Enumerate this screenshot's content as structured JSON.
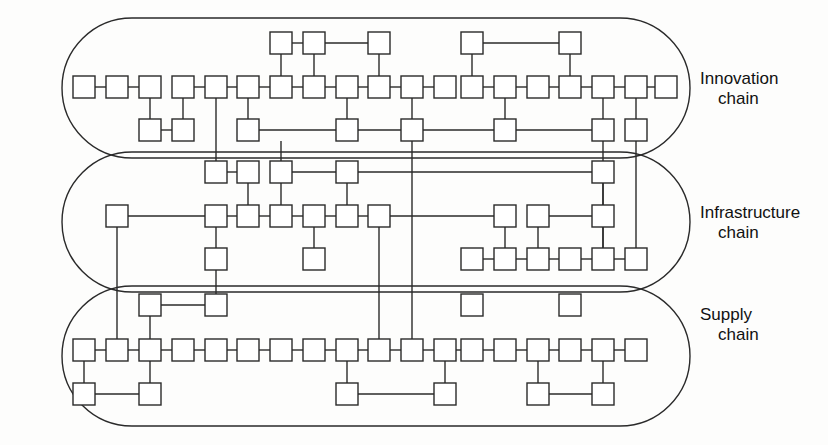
{
  "figure": {
    "background_color": "#fdfdfc",
    "line_color": "#2a2a2a",
    "node_fill": "#ffffff"
  },
  "lanes": [
    {
      "id": "innovation",
      "label_line1": "Innovation",
      "label_line2": "chain",
      "label_x": 700,
      "label_y": 84,
      "capsule": {
        "x": 62,
        "y": 18,
        "w": 628,
        "h": 140,
        "r": 70
      }
    },
    {
      "id": "infrastructure",
      "label_line1": "Infrastructure",
      "label_line2": "chain",
      "label_x": 700,
      "label_y": 218,
      "capsule": {
        "x": 62,
        "y": 152,
        "w": 628,
        "h": 140,
        "r": 70
      }
    },
    {
      "id": "supply",
      "label_line1": "Supply",
      "label_line2": "chain",
      "label_x": 700,
      "label_y": 320,
      "capsule": {
        "x": 62,
        "y": 286,
        "w": 628,
        "h": 140,
        "r": 70
      }
    }
  ],
  "node_size": {
    "w": 22,
    "h": 22
  },
  "rows": {
    "innovation_top": 43,
    "innovation_main": 87,
    "innovation_bottom": 130,
    "infrastructure_top": 172,
    "infrastructure_main": 216,
    "infrastructure_bottom": 259,
    "supply_top": 305,
    "supply_main": 350,
    "supply_bottom": 394
  },
  "nodes": [
    {
      "id": "it1",
      "x": 281,
      "y": 43
    },
    {
      "id": "it2",
      "x": 314,
      "y": 43
    },
    {
      "id": "it3",
      "x": 379,
      "y": 43
    },
    {
      "id": "it4",
      "x": 472,
      "y": 43
    },
    {
      "id": "it5",
      "x": 570,
      "y": 43
    },
    {
      "id": "im1",
      "x": 84,
      "y": 87
    },
    {
      "id": "im2",
      "x": 117,
      "y": 87
    },
    {
      "id": "im3",
      "x": 150,
      "y": 87
    },
    {
      "id": "im4",
      "x": 183,
      "y": 87
    },
    {
      "id": "im5",
      "x": 216,
      "y": 87
    },
    {
      "id": "im6",
      "x": 248,
      "y": 87
    },
    {
      "id": "im7",
      "x": 281,
      "y": 87
    },
    {
      "id": "im8",
      "x": 314,
      "y": 87
    },
    {
      "id": "im9",
      "x": 347,
      "y": 87
    },
    {
      "id": "im10",
      "x": 379,
      "y": 87
    },
    {
      "id": "im11",
      "x": 412,
      "y": 87
    },
    {
      "id": "im12",
      "x": 445,
      "y": 87
    },
    {
      "id": "im13",
      "x": 472,
      "y": 87
    },
    {
      "id": "im14",
      "x": 505,
      "y": 87
    },
    {
      "id": "im15",
      "x": 538,
      "y": 87
    },
    {
      "id": "im16",
      "x": 570,
      "y": 87
    },
    {
      "id": "im17",
      "x": 603,
      "y": 87
    },
    {
      "id": "im18",
      "x": 636,
      "y": 87
    },
    {
      "id": "im19",
      "x": 666,
      "y": 87
    },
    {
      "id": "ib1",
      "x": 150,
      "y": 130
    },
    {
      "id": "ib2",
      "x": 183,
      "y": 130
    },
    {
      "id": "ib3",
      "x": 248,
      "y": 130
    },
    {
      "id": "ib4",
      "x": 347,
      "y": 130
    },
    {
      "id": "ib5",
      "x": 412,
      "y": 130
    },
    {
      "id": "ib6",
      "x": 505,
      "y": 130
    },
    {
      "id": "ib7",
      "x": 603,
      "y": 130
    },
    {
      "id": "ib8",
      "x": 636,
      "y": 130
    },
    {
      "id": "ft1",
      "x": 216,
      "y": 172
    },
    {
      "id": "ft2",
      "x": 248,
      "y": 172
    },
    {
      "id": "ft3",
      "x": 281,
      "y": 172
    },
    {
      "id": "ft4",
      "x": 347,
      "y": 172
    },
    {
      "id": "ft5",
      "x": 603,
      "y": 172
    },
    {
      "id": "fm0",
      "x": 117,
      "y": 216
    },
    {
      "id": "fm1",
      "x": 216,
      "y": 216
    },
    {
      "id": "fm2",
      "x": 248,
      "y": 216
    },
    {
      "id": "fm3",
      "x": 281,
      "y": 216
    },
    {
      "id": "fm4",
      "x": 314,
      "y": 216
    },
    {
      "id": "fm5",
      "x": 347,
      "y": 216
    },
    {
      "id": "fm6",
      "x": 379,
      "y": 216
    },
    {
      "id": "fm7",
      "x": 505,
      "y": 216
    },
    {
      "id": "fm8",
      "x": 538,
      "y": 216
    },
    {
      "id": "fm9",
      "x": 603,
      "y": 216
    },
    {
      "id": "fb1",
      "x": 216,
      "y": 259
    },
    {
      "id": "fb2",
      "x": 314,
      "y": 259
    },
    {
      "id": "fb3",
      "x": 472,
      "y": 259
    },
    {
      "id": "fb4",
      "x": 505,
      "y": 259
    },
    {
      "id": "fb5",
      "x": 538,
      "y": 259
    },
    {
      "id": "fb6",
      "x": 570,
      "y": 259
    },
    {
      "id": "fb7",
      "x": 603,
      "y": 259
    },
    {
      "id": "fb8",
      "x": 636,
      "y": 259
    },
    {
      "id": "st1",
      "x": 150,
      "y": 305
    },
    {
      "id": "st2",
      "x": 216,
      "y": 305
    },
    {
      "id": "st3",
      "x": 472,
      "y": 305
    },
    {
      "id": "st4",
      "x": 570,
      "y": 305
    },
    {
      "id": "sm1",
      "x": 84,
      "y": 350
    },
    {
      "id": "sm2",
      "x": 117,
      "y": 350
    },
    {
      "id": "sm3",
      "x": 150,
      "y": 350
    },
    {
      "id": "sm4",
      "x": 183,
      "y": 350
    },
    {
      "id": "sm5",
      "x": 216,
      "y": 350
    },
    {
      "id": "sm6",
      "x": 248,
      "y": 350
    },
    {
      "id": "sm7",
      "x": 281,
      "y": 350
    },
    {
      "id": "sm8",
      "x": 314,
      "y": 350
    },
    {
      "id": "sm9",
      "x": 347,
      "y": 350
    },
    {
      "id": "sm10",
      "x": 379,
      "y": 350
    },
    {
      "id": "sm11",
      "x": 412,
      "y": 350
    },
    {
      "id": "sm12",
      "x": 445,
      "y": 350
    },
    {
      "id": "sm13",
      "x": 472,
      "y": 350
    },
    {
      "id": "sm14",
      "x": 505,
      "y": 350
    },
    {
      "id": "sm15",
      "x": 538,
      "y": 350
    },
    {
      "id": "sm16",
      "x": 570,
      "y": 350
    },
    {
      "id": "sm17",
      "x": 603,
      "y": 350
    },
    {
      "id": "sm18",
      "x": 636,
      "y": 350
    },
    {
      "id": "sb1",
      "x": 84,
      "y": 394
    },
    {
      "id": "sb2",
      "x": 150,
      "y": 394
    },
    {
      "id": "sb3",
      "x": 347,
      "y": 394
    },
    {
      "id": "sb4",
      "x": 445,
      "y": 394
    },
    {
      "id": "sb5",
      "x": 538,
      "y": 394
    },
    {
      "id": "sb6",
      "x": 603,
      "y": 394
    }
  ],
  "edges": [
    {
      "from": "it1",
      "to": "it2"
    },
    {
      "from": "it2",
      "to": "it3"
    },
    {
      "from": "it4",
      "to": "it5"
    },
    {
      "from": "it1",
      "to": "im7"
    },
    {
      "from": "it2",
      "to": "im8"
    },
    {
      "from": "it3",
      "to": "im10"
    },
    {
      "from": "it4",
      "to": "im13"
    },
    {
      "from": "it5",
      "to": "im16"
    },
    {
      "from": "im1",
      "to": "im2"
    },
    {
      "from": "im2",
      "to": "im3"
    },
    {
      "from": "im4",
      "to": "im5"
    },
    {
      "from": "im5",
      "to": "im6"
    },
    {
      "from": "im6",
      "to": "im7"
    },
    {
      "from": "im7",
      "to": "im8"
    },
    {
      "from": "im8",
      "to": "im9"
    },
    {
      "from": "im9",
      "to": "im10"
    },
    {
      "from": "im10",
      "to": "im11"
    },
    {
      "from": "im11",
      "to": "im12"
    },
    {
      "from": "im13",
      "to": "im14"
    },
    {
      "from": "im14",
      "to": "im15"
    },
    {
      "from": "im15",
      "to": "im16"
    },
    {
      "from": "im16",
      "to": "im17"
    },
    {
      "from": "im17",
      "to": "im18"
    },
    {
      "from": "im18",
      "to": "im19"
    },
    {
      "from": "im3",
      "to": "ib1"
    },
    {
      "from": "im4",
      "to": "ib2"
    },
    {
      "from": "im6",
      "to": "ib3"
    },
    {
      "from": "im9",
      "to": "ib4"
    },
    {
      "from": "im11",
      "to": "ib5"
    },
    {
      "from": "im14",
      "to": "ib6"
    },
    {
      "from": "im17",
      "to": "ib7"
    },
    {
      "from": "im18",
      "to": "ib8"
    },
    {
      "from": "ib1",
      "to": "ib2"
    },
    {
      "from": "ib3",
      "to": "ib4"
    },
    {
      "from": "ib4",
      "to": "ib6"
    },
    {
      "from": "ib6",
      "to": "ib7"
    },
    {
      "from": "ft1",
      "to": "ft2"
    },
    {
      "from": "ft3",
      "to": "ft4"
    },
    {
      "from": "ft4",
      "to": "ft5"
    },
    {
      "from": "ft2",
      "to": "fm2"
    },
    {
      "from": "ft3",
      "to": "fm3"
    },
    {
      "from": "ft4",
      "to": "fm5"
    },
    {
      "from": "ft5",
      "to": "fm9"
    },
    {
      "from": "fm0",
      "to": "fm1"
    },
    {
      "from": "fm1",
      "to": "fm2"
    },
    {
      "from": "fm2",
      "to": "fm3"
    },
    {
      "from": "fm3",
      "to": "fm4"
    },
    {
      "from": "fm4",
      "to": "fm5"
    },
    {
      "from": "fm5",
      "to": "fm6"
    },
    {
      "from": "fm6",
      "to": "fm7"
    },
    {
      "from": "fm8",
      "to": "fm9"
    },
    {
      "from": "fm1",
      "to": "fb1"
    },
    {
      "from": "fm4",
      "to": "fb2"
    },
    {
      "from": "fm7",
      "to": "fb4"
    },
    {
      "from": "fm8",
      "to": "fb5"
    },
    {
      "from": "fm9",
      "to": "fb7"
    },
    {
      "from": "fb3",
      "to": "fb4"
    },
    {
      "from": "fb4",
      "to": "fb5"
    },
    {
      "from": "fb5",
      "to": "fb6"
    },
    {
      "from": "fb6",
      "to": "fb7"
    },
    {
      "from": "fb7",
      "to": "fb8"
    },
    {
      "from": "st1",
      "to": "st2"
    },
    {
      "from": "st1",
      "to": "sm3"
    },
    {
      "from": "sm1",
      "to": "sm2"
    },
    {
      "from": "sm2",
      "to": "sm3"
    },
    {
      "from": "sm3",
      "to": "sm4"
    },
    {
      "from": "sm4",
      "to": "sm5"
    },
    {
      "from": "sm5",
      "to": "sm6"
    },
    {
      "from": "sm6",
      "to": "sm7"
    },
    {
      "from": "sm7",
      "to": "sm8"
    },
    {
      "from": "sm8",
      "to": "sm9"
    },
    {
      "from": "sm9",
      "to": "sm10"
    },
    {
      "from": "sm10",
      "to": "sm11"
    },
    {
      "from": "sm11",
      "to": "sm12"
    },
    {
      "from": "sm12",
      "to": "sm13"
    },
    {
      "from": "sm13",
      "to": "sm14"
    },
    {
      "from": "sm14",
      "to": "sm15"
    },
    {
      "from": "sm15",
      "to": "sm16"
    },
    {
      "from": "sm16",
      "to": "sm17"
    },
    {
      "from": "sm17",
      "to": "sm18"
    },
    {
      "from": "sm1",
      "to": "sb1"
    },
    {
      "from": "sm3",
      "to": "sb2"
    },
    {
      "from": "sm9",
      "to": "sb3"
    },
    {
      "from": "sm12",
      "to": "sb4"
    },
    {
      "from": "sm15",
      "to": "sb5"
    },
    {
      "from": "sm17",
      "to": "sb6"
    },
    {
      "from": "sb1",
      "to": "sb2"
    },
    {
      "from": "sb3",
      "to": "sb4"
    },
    {
      "from": "sb5",
      "to": "sb6"
    }
  ],
  "cross_lane_edges": [
    {
      "id": "x1",
      "x": 216,
      "from_y": 98,
      "to_y": 172,
      "desc": "innovation-main-5 to infrastructure-top-1"
    },
    {
      "id": "x2",
      "x": 281,
      "from_y": 141,
      "to_y": 172,
      "desc": "innovation-bottom to infrastructure-top-3"
    },
    {
      "id": "x3",
      "x": 412,
      "from_y": 141,
      "to_y": 350,
      "desc": "innovation-bottom-5 down to supply-main-11"
    },
    {
      "id": "x4",
      "x": 379,
      "from_y": 227,
      "to_y": 350,
      "desc": "infrastructure-main-6 down to supply-main-10"
    },
    {
      "id": "x5",
      "x": 603,
      "from_y": 141,
      "to_y": 259,
      "desc": "innovation-bottom-7 down to infrastructure-bottom-7"
    },
    {
      "id": "x6",
      "x": 636,
      "from_y": 141,
      "to_y": 259,
      "desc": "innovation-bottom-8 down to infrastructure-bottom-8"
    },
    {
      "id": "x7",
      "x": 117,
      "from_y": 227,
      "to_y": 350,
      "desc": "infrastructure-main-0 down to supply-main-2"
    },
    {
      "id": "x8",
      "x": 216,
      "from_y": 270,
      "to_y": 305,
      "desc": "infrastructure-bottom-1 to supply-top-2"
    }
  ]
}
